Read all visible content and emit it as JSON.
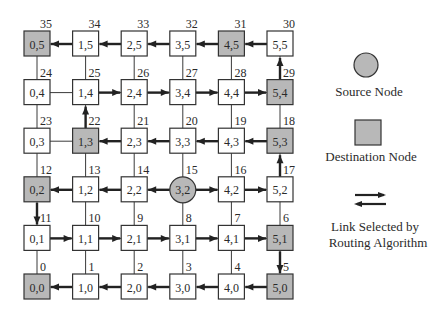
{
  "diagram": {
    "colors": {
      "line": "#3a3a3a",
      "arrow": "#222222",
      "node_fill": "#ffffff",
      "dest_fill": "#b8b8b8",
      "source_fill": "#b8b8b8",
      "stroke": "#333333"
    },
    "grid": {
      "cols": 6,
      "rows": 6,
      "origin_x": 37,
      "origin_y": 287,
      "spacing_x": 48.6,
      "spacing_y": 48.6,
      "node_size": 26
    },
    "nodes": [
      {
        "x": 0,
        "y": 0,
        "label": "0,0",
        "index": "0",
        "type": "destination"
      },
      {
        "x": 1,
        "y": 0,
        "label": "1,0",
        "index": "1",
        "type": "normal"
      },
      {
        "x": 2,
        "y": 0,
        "label": "2,0",
        "index": "2",
        "type": "normal"
      },
      {
        "x": 3,
        "y": 0,
        "label": "3,0",
        "index": "3",
        "type": "normal"
      },
      {
        "x": 4,
        "y": 0,
        "label": "4,0",
        "index": "4",
        "type": "normal"
      },
      {
        "x": 5,
        "y": 0,
        "label": "5,0",
        "index": "5",
        "type": "destination"
      },
      {
        "x": 5,
        "y": 1,
        "label": "5,1",
        "index": "6",
        "type": "destination"
      },
      {
        "x": 4,
        "y": 1,
        "label": "4,1",
        "index": "7",
        "type": "normal"
      },
      {
        "x": 3,
        "y": 1,
        "label": "3,1",
        "index": "8",
        "type": "normal"
      },
      {
        "x": 2,
        "y": 1,
        "label": "2,1",
        "index": "9",
        "type": "normal"
      },
      {
        "x": 1,
        "y": 1,
        "label": "1,1",
        "index": "10",
        "type": "normal"
      },
      {
        "x": 0,
        "y": 1,
        "label": "0,1",
        "index": "11",
        "type": "normal"
      },
      {
        "x": 0,
        "y": 2,
        "label": "0,2",
        "index": "12",
        "type": "destination"
      },
      {
        "x": 1,
        "y": 2,
        "label": "1,2",
        "index": "13",
        "type": "normal"
      },
      {
        "x": 2,
        "y": 2,
        "label": "2,2",
        "index": "14",
        "type": "normal"
      },
      {
        "x": 3,
        "y": 2,
        "label": "3,2",
        "index": "15",
        "type": "source"
      },
      {
        "x": 4,
        "y": 2,
        "label": "4,2",
        "index": "16",
        "type": "normal"
      },
      {
        "x": 5,
        "y": 2,
        "label": "5,2",
        "index": "17",
        "type": "normal"
      },
      {
        "x": 5,
        "y": 3,
        "label": "5,3",
        "index": "18",
        "type": "destination"
      },
      {
        "x": 4,
        "y": 3,
        "label": "4,3",
        "index": "19",
        "type": "normal"
      },
      {
        "x": 3,
        "y": 3,
        "label": "3,3",
        "index": "20",
        "type": "normal"
      },
      {
        "x": 2,
        "y": 3,
        "label": "2,3",
        "index": "21",
        "type": "normal"
      },
      {
        "x": 1,
        "y": 3,
        "label": "1,3",
        "index": "22",
        "type": "destination"
      },
      {
        "x": 0,
        "y": 3,
        "label": "0,3",
        "index": "23",
        "type": "normal"
      },
      {
        "x": 0,
        "y": 4,
        "label": "0,4",
        "index": "24",
        "type": "normal"
      },
      {
        "x": 1,
        "y": 4,
        "label": "1,4",
        "index": "25",
        "type": "normal"
      },
      {
        "x": 2,
        "y": 4,
        "label": "2,4",
        "index": "26",
        "type": "normal"
      },
      {
        "x": 3,
        "y": 4,
        "label": "3,4",
        "index": "27",
        "type": "normal"
      },
      {
        "x": 4,
        "y": 4,
        "label": "4,4",
        "index": "28",
        "type": "normal"
      },
      {
        "x": 5,
        "y": 4,
        "label": "5,4",
        "index": "29",
        "type": "destination"
      },
      {
        "x": 5,
        "y": 5,
        "label": "5,5",
        "index": "30",
        "type": "normal"
      },
      {
        "x": 4,
        "y": 5,
        "label": "4,5",
        "index": "31",
        "type": "destination"
      },
      {
        "x": 3,
        "y": 5,
        "label": "3,5",
        "index": "32",
        "type": "normal"
      },
      {
        "x": 2,
        "y": 5,
        "label": "2,5",
        "index": "33",
        "type": "normal"
      },
      {
        "x": 1,
        "y": 5,
        "label": "1,5",
        "index": "34",
        "type": "normal"
      },
      {
        "x": 0,
        "y": 5,
        "label": "0,5",
        "index": "35",
        "type": "destination"
      }
    ],
    "selected_links": [
      {
        "from": [
          5,
          5
        ],
        "to": [
          4,
          5
        ]
      },
      {
        "from": [
          4,
          5
        ],
        "to": [
          3,
          5
        ]
      },
      {
        "from": [
          3,
          5
        ],
        "to": [
          2,
          5
        ]
      },
      {
        "from": [
          2,
          5
        ],
        "to": [
          1,
          5
        ]
      },
      {
        "from": [
          1,
          5
        ],
        "to": [
          0,
          5
        ]
      },
      {
        "from": [
          1,
          4
        ],
        "to": [
          2,
          4
        ]
      },
      {
        "from": [
          2,
          4
        ],
        "to": [
          3,
          4
        ]
      },
      {
        "from": [
          3,
          4
        ],
        "to": [
          4,
          4
        ]
      },
      {
        "from": [
          4,
          4
        ],
        "to": [
          5,
          4
        ]
      },
      {
        "from": [
          5,
          4
        ],
        "to": [
          5,
          5
        ]
      },
      {
        "from": [
          5,
          3
        ],
        "to": [
          4,
          3
        ]
      },
      {
        "from": [
          4,
          3
        ],
        "to": [
          3,
          3
        ]
      },
      {
        "from": [
          3,
          3
        ],
        "to": [
          2,
          3
        ]
      },
      {
        "from": [
          2,
          3
        ],
        "to": [
          1,
          3
        ]
      },
      {
        "from": [
          1,
          3
        ],
        "to": [
          1,
          4
        ]
      },
      {
        "from": [
          3,
          2
        ],
        "to": [
          2,
          2
        ]
      },
      {
        "from": [
          2,
          2
        ],
        "to": [
          1,
          2
        ]
      },
      {
        "from": [
          1,
          2
        ],
        "to": [
          0,
          2
        ]
      },
      {
        "from": [
          3,
          2
        ],
        "to": [
          4,
          2
        ]
      },
      {
        "from": [
          4,
          2
        ],
        "to": [
          5,
          2
        ]
      },
      {
        "from": [
          5,
          2
        ],
        "to": [
          5,
          3
        ]
      },
      {
        "from": [
          0,
          2
        ],
        "to": [
          0,
          1
        ]
      },
      {
        "from": [
          0,
          1
        ],
        "to": [
          1,
          1
        ]
      },
      {
        "from": [
          1,
          1
        ],
        "to": [
          2,
          1
        ]
      },
      {
        "from": [
          2,
          1
        ],
        "to": [
          3,
          1
        ]
      },
      {
        "from": [
          3,
          1
        ],
        "to": [
          4,
          1
        ]
      },
      {
        "from": [
          4,
          1
        ],
        "to": [
          5,
          1
        ]
      },
      {
        "from": [
          5,
          1
        ],
        "to": [
          5,
          0
        ]
      },
      {
        "from": [
          5,
          0
        ],
        "to": [
          4,
          0
        ]
      },
      {
        "from": [
          4,
          0
        ],
        "to": [
          3,
          0
        ]
      },
      {
        "from": [
          3,
          0
        ],
        "to": [
          2,
          0
        ]
      },
      {
        "from": [
          2,
          0
        ],
        "to": [
          1,
          0
        ]
      },
      {
        "from": [
          1,
          0
        ],
        "to": [
          0,
          0
        ]
      }
    ]
  },
  "legend": {
    "source_label": "Source Node",
    "destination_label": "Destination Node",
    "link_label_line1": "Link Selected by",
    "link_label_line2": "Routing Algorithm"
  }
}
